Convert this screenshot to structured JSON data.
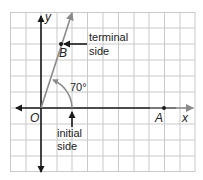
{
  "diagram": {
    "colors": {
      "grid": "#c9c9c9",
      "axis": "#1a1a1a",
      "ray": "#8a8a8a",
      "text": "#222222",
      "background": "#ffffff"
    },
    "axes": {
      "x_label": "x",
      "y_label": "y"
    },
    "points": {
      "origin": "O",
      "a": "A",
      "b": "B"
    },
    "angle": {
      "measure": "70°"
    },
    "annotations": {
      "terminal_line1": "terminal",
      "terminal_line2": "side",
      "initial_line1": "initial",
      "initial_line2": "side"
    }
  }
}
